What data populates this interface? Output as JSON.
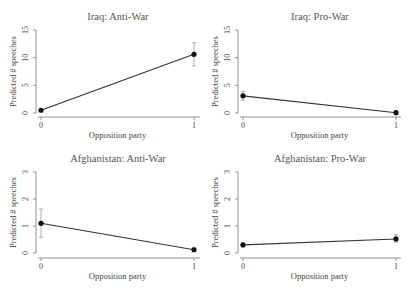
{
  "chart_data": [
    {
      "type": "line",
      "title": "Iraq: Anti-War",
      "xlabel": "Opposition party",
      "ylabel": "Predicted # speeches",
      "x": [
        0,
        1
      ],
      "x_ticks": [
        "0",
        "1"
      ],
      "y_ticks": [
        0,
        5,
        10,
        15
      ],
      "ylim": [
        0,
        15
      ],
      "values": [
        0.5,
        10.6
      ],
      "ci_low": [
        0.3,
        8.5
      ],
      "ci_high": [
        0.7,
        12.7
      ]
    },
    {
      "type": "line",
      "title": "Iraq: Pro-War",
      "xlabel": "Opposition party",
      "ylabel": "Predicted # speeches",
      "x": [
        0,
        1
      ],
      "x_ticks": [
        "0",
        "1"
      ],
      "y_ticks": [
        0,
        5,
        10,
        15
      ],
      "ylim": [
        0,
        15
      ],
      "values": [
        3.1,
        0.05
      ],
      "ci_low": [
        2.3,
        0.0
      ],
      "ci_high": [
        3.9,
        0.15
      ]
    },
    {
      "type": "line",
      "title": "Afghanistan: Anti-War",
      "xlabel": "Opposition party",
      "ylabel": "Predicted # speeches",
      "x": [
        0,
        1
      ],
      "x_ticks": [
        "0",
        "1"
      ],
      "y_ticks": [
        0,
        1,
        2,
        3
      ],
      "ylim": [
        0,
        3
      ],
      "values": [
        1.1,
        0.12
      ],
      "ci_low": [
        0.58,
        0.05
      ],
      "ci_high": [
        1.63,
        0.2
      ]
    },
    {
      "type": "line",
      "title": "Afghanistan: Pro-War",
      "xlabel": "Opposition party",
      "ylabel": "Predicted # speeches",
      "x": [
        0,
        1
      ],
      "x_ticks": [
        "0",
        "1"
      ],
      "y_ticks": [
        0,
        1,
        2,
        3
      ],
      "ylim": [
        0,
        3
      ],
      "values": [
        0.3,
        0.52
      ],
      "ci_low": [
        0.25,
        0.4
      ],
      "ci_high": [
        0.37,
        0.68
      ]
    }
  ]
}
